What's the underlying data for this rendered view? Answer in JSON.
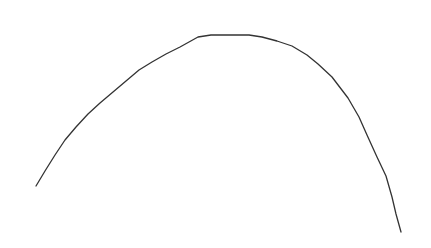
{
  "canvas": {
    "width": 431,
    "height": 248,
    "background": "#ffffff"
  },
  "curve": {
    "shape": "arch",
    "stroke": "#333333",
    "stroke_width": 1.3,
    "points": [
      [
        36,
        186
      ],
      [
        45,
        171
      ],
      [
        55,
        155
      ],
      [
        65,
        140
      ],
      [
        76,
        127
      ],
      [
        88,
        114
      ],
      [
        100,
        103
      ],
      [
        113,
        92
      ],
      [
        126,
        81
      ],
      [
        139,
        70
      ],
      [
        152,
        62
      ],
      [
        166,
        54
      ],
      [
        180,
        47
      ],
      [
        198,
        37
      ],
      [
        211,
        35
      ],
      [
        249,
        35
      ],
      [
        262,
        37
      ],
      [
        277,
        41
      ],
      [
        292,
        46
      ],
      [
        307,
        55
      ],
      [
        318,
        64
      ],
      [
        332,
        77
      ],
      [
        348,
        98
      ],
      [
        359,
        117
      ],
      [
        367,
        135
      ],
      [
        377,
        157
      ],
      [
        386,
        176
      ],
      [
        392,
        197
      ],
      [
        396,
        214
      ],
      [
        401,
        232
      ]
    ]
  }
}
